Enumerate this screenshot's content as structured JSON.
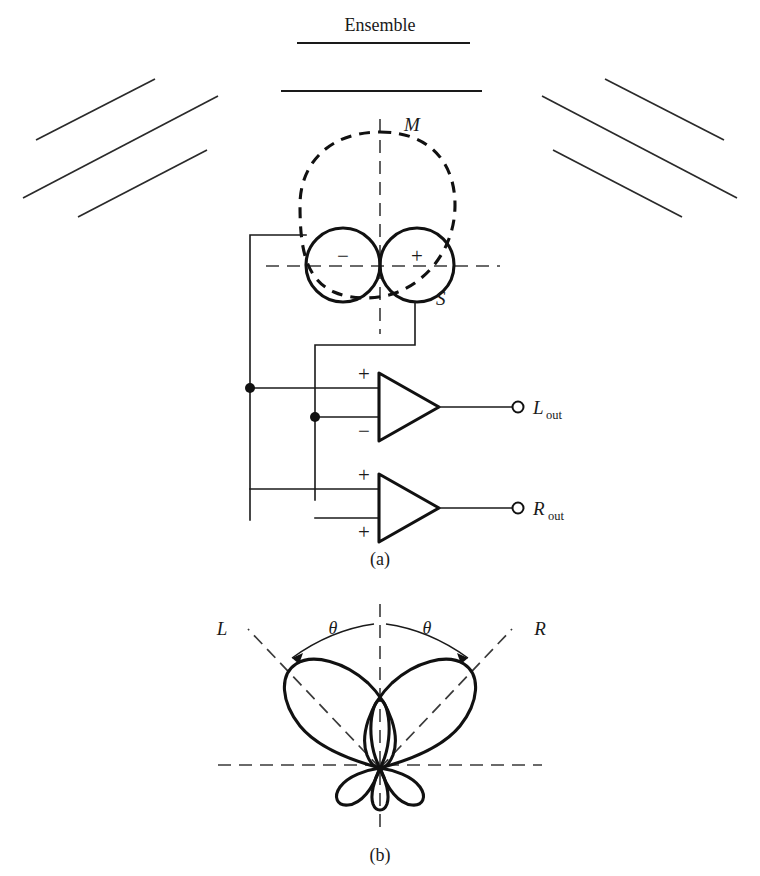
{
  "figure": {
    "heading": "Ensemble",
    "panel_a_caption": "(a)",
    "panel_b_caption": "(b)"
  },
  "panel_a": {
    "mid_label": "M",
    "side_label": "S",
    "side_minus_sign": "−",
    "side_plus_sign": "+",
    "amp_top": {
      "input_plus": "+",
      "input_minus": "−",
      "output_label": "L",
      "output_sub": "out"
    },
    "amp_bottom": {
      "input_plus_top": "+",
      "input_plus_bottom": "+",
      "output_label": "R",
      "output_sub": "out"
    }
  },
  "panel_b": {
    "left_label": "L",
    "right_label": "R",
    "angle_label_left": "θ",
    "angle_label_right": "θ"
  },
  "colors": {
    "ink": "#1a1a1a",
    "bold_ink": "#111111",
    "axis_gray": "#3a3a3a",
    "paper": "#ffffff"
  }
}
